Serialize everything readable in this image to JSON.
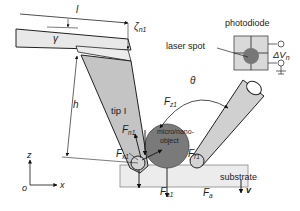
{
  "diagram": {
    "labels": {
      "cantilever_length": "l",
      "deflection": "ζ",
      "deflection_sub": "n1",
      "tilt_angle": "γ",
      "tip_height": "h",
      "angle_between_tips": "θ",
      "tip_name": "tip I",
      "photodiode": "photodiode",
      "laser_spot": "laser spot",
      "voltage": "ΔV",
      "voltage_sub": "n",
      "object": "micro/nano-",
      "object_line2": "object",
      "substrate": "substrate",
      "velocity": "v",
      "axis_z": "z",
      "axis_x": "x",
      "origin": "o"
    },
    "forces": {
      "Fz1": {
        "main": "F",
        "sub": "z1"
      },
      "Fn1": {
        "main": "F",
        "sub": "n1"
      },
      "Fx1": {
        "main": "F",
        "sub": "x1"
      },
      "Fr1": {
        "main": "F",
        "sub": "r1"
      },
      "Fa1": {
        "main": "F",
        "sub": "a1"
      },
      "Fa": {
        "main": "F",
        "sub": "a"
      }
    },
    "colors": {
      "cantilever": "#e8e8e8",
      "tip": "#c4c4c4",
      "tip_right": "#d0d0d0",
      "object": "#7a7a7a",
      "substrate": "#ececec",
      "photodiode_box": "#d9d9d9",
      "stroke": "#222222"
    }
  }
}
